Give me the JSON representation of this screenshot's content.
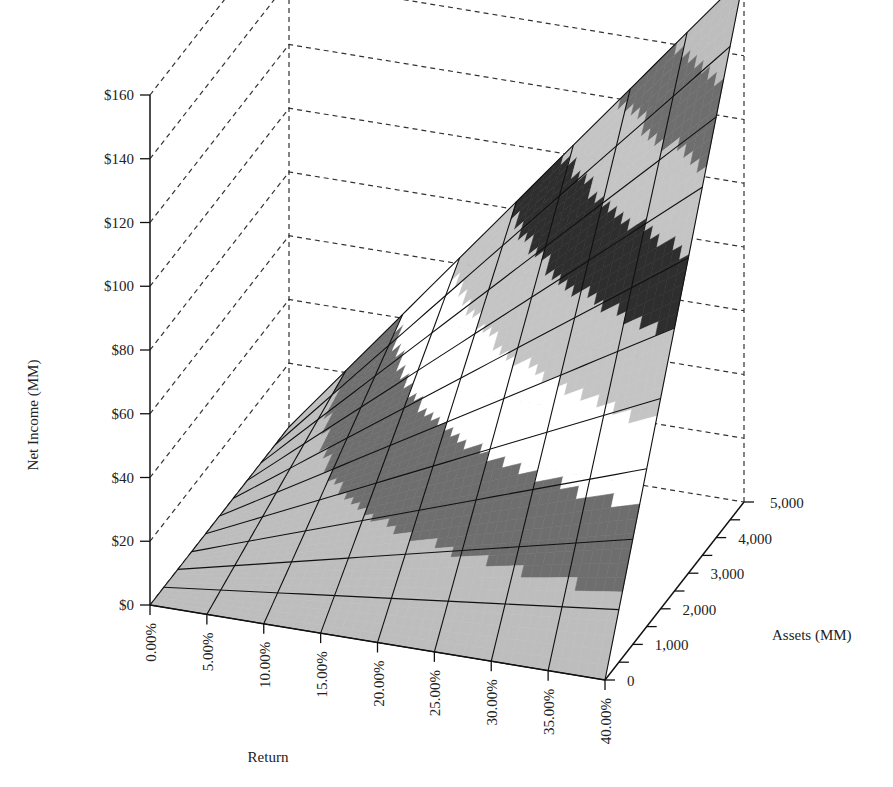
{
  "chart_data": {
    "type": "surface-3d",
    "title": "",
    "xlabel": "Return",
    "ylabel": "Assets (MM)",
    "zlabel": "Net Income (MM)",
    "x_ticks": [
      "0.00%",
      "5.00%",
      "10.00%",
      "15.00%",
      "20.00%",
      "25.00%",
      "30.00%",
      "35.00%",
      "40.00%"
    ],
    "x_values": [
      0,
      0.05,
      0.1,
      0.15,
      0.2,
      0.25,
      0.3,
      0.35,
      0.4
    ],
    "y_ticks": [
      "0",
      "1,000",
      "2,000",
      "3,000",
      "4,000",
      "5,000"
    ],
    "y_values": [
      0,
      1000,
      2000,
      3000,
      4000,
      5000
    ],
    "z_ticks": [
      "$0",
      "$20",
      "$40",
      "$60",
      "$80",
      "$100",
      "$120",
      "$140",
      "$160"
    ],
    "z_values": [
      0,
      20,
      40,
      60,
      80,
      100,
      120,
      140,
      160
    ],
    "zlim": [
      0,
      160
    ],
    "xlim": [
      0,
      0.4
    ],
    "ylim": [
      0,
      5000
    ],
    "grid": true,
    "formula": "Net Income = Return × Assets (scaled)",
    "surface_peak_approx": 165,
    "band_colors": [
      "#bdbdbd",
      "#6e6e6e",
      "#ffffff",
      "#c4c4c4",
      "#2e2e2e",
      "#c4c4c4",
      "#6e6e6e",
      "#bdbdbd"
    ],
    "band_edges": [
      0,
      20,
      40,
      60,
      80,
      100,
      120,
      140,
      160
    ]
  }
}
